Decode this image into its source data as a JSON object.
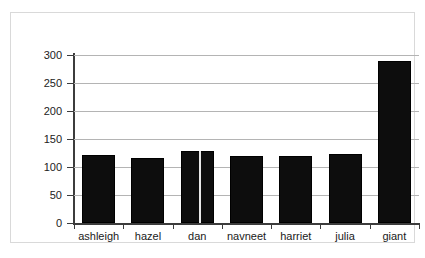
{
  "chart_data": {
    "type": "bar",
    "title": "",
    "subtitle": "",
    "xlabel": "",
    "ylabel": "",
    "categories": [
      "ashleigh",
      "hazel",
      "dan",
      "navneet",
      "harriet",
      "julia",
      "giant"
    ],
    "values": [
      121,
      116,
      128,
      120,
      119,
      124,
      290
    ],
    "ylim": [
      0,
      300
    ],
    "yticks": [
      0,
      50,
      100,
      150,
      200,
      250,
      300
    ],
    "ytick_labels": [
      "0",
      "50",
      "100",
      "150",
      "200",
      "250",
      "300"
    ],
    "grid": true,
    "legend": false,
    "legend_position": "none",
    "bar_color": "#0d0d0d",
    "gridline_color": "#b4b4b4",
    "axis_color": "#3c3c3c",
    "frame_color": "#d9d9d9",
    "background_color": "#ffffff",
    "annotations": []
  }
}
